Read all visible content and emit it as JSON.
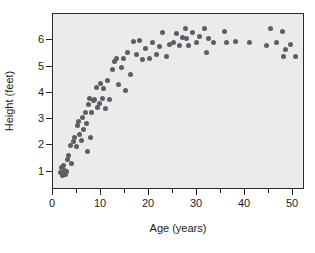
{
  "chart_data": {
    "type": "scatter",
    "title": "",
    "xlabel": "Age (years)",
    "ylabel": "Height (feet)",
    "xlim": [
      0,
      52.5
    ],
    "ylim": [
      0.3,
      7.0
    ],
    "xticks": [
      0,
      10,
      20,
      30,
      40,
      50
    ],
    "xticks_minor": [
      5,
      15,
      25,
      35,
      45
    ],
    "yticks": [
      1,
      2,
      3,
      4,
      5,
      6
    ],
    "grid": false,
    "legend": null,
    "point_color": "#595f66",
    "plot_background": "#ebebeb",
    "frame_color": "#2b2b2b",
    "series": [
      {
        "name": "Height vs Age",
        "points": [
          [
            1.6,
            0.95
          ],
          [
            1.8,
            1.15
          ],
          [
            1.9,
            0.85
          ],
          [
            2.1,
            1.25
          ],
          [
            2.4,
            1.05
          ],
          [
            2.6,
            0.9
          ],
          [
            2.8,
            1.0
          ],
          [
            3.0,
            1.45
          ],
          [
            3.3,
            1.6
          ],
          [
            3.6,
            2.0
          ],
          [
            3.9,
            1.3
          ],
          [
            4.2,
            2.15
          ],
          [
            4.5,
            2.3
          ],
          [
            4.8,
            1.95
          ],
          [
            5.1,
            2.75
          ],
          [
            5.3,
            2.9
          ],
          [
            5.6,
            2.4
          ],
          [
            5.9,
            2.2
          ],
          [
            6.2,
            3.05
          ],
          [
            6.4,
            2.6
          ],
          [
            6.7,
            3.25
          ],
          [
            6.9,
            2.85
          ],
          [
            7.1,
            1.75
          ],
          [
            7.4,
            3.55
          ],
          [
            7.6,
            3.8
          ],
          [
            7.8,
            2.3
          ],
          [
            8.1,
            3.25
          ],
          [
            8.4,
            3.7
          ],
          [
            8.7,
            3.75
          ],
          [
            9.0,
            4.2
          ],
          [
            9.3,
            3.45
          ],
          [
            9.6,
            3.6
          ],
          [
            9.9,
            4.35
          ],
          [
            10.3,
            3.8
          ],
          [
            10.6,
            4.15
          ],
          [
            11.0,
            3.4
          ],
          [
            11.4,
            4.45
          ],
          [
            11.8,
            3.75
          ],
          [
            12.3,
            4.9
          ],
          [
            12.8,
            5.2
          ],
          [
            13.2,
            5.3
          ],
          [
            13.6,
            4.3
          ],
          [
            14.2,
            4.95
          ],
          [
            14.7,
            5.3
          ],
          [
            15.1,
            4.1
          ],
          [
            15.6,
            5.55
          ],
          [
            16.2,
            4.7
          ],
          [
            16.8,
            5.95
          ],
          [
            17.4,
            5.45
          ],
          [
            18.0,
            6.0
          ],
          [
            18.6,
            5.25
          ],
          [
            19.3,
            5.7
          ],
          [
            20.0,
            5.3
          ],
          [
            20.8,
            5.9
          ],
          [
            21.5,
            5.45
          ],
          [
            22.2,
            5.75
          ],
          [
            22.9,
            6.3
          ],
          [
            23.6,
            5.4
          ],
          [
            24.3,
            5.85
          ],
          [
            25.1,
            5.9
          ],
          [
            25.8,
            6.25
          ],
          [
            26.4,
            5.8
          ],
          [
            27.0,
            6.1
          ],
          [
            27.5,
            6.45
          ],
          [
            27.9,
            6.05
          ],
          [
            28.3,
            5.8
          ],
          [
            29.0,
            6.3
          ],
          [
            29.8,
            5.9
          ],
          [
            30.5,
            6.15
          ],
          [
            31.5,
            6.45
          ],
          [
            32.0,
            5.55
          ],
          [
            32.4,
            6.05
          ],
          [
            33.5,
            5.9
          ],
          [
            35.8,
            6.35
          ],
          [
            36.2,
            5.9
          ],
          [
            38.0,
            5.95
          ],
          [
            41.0,
            5.9
          ],
          [
            44.5,
            5.8
          ],
          [
            45.3,
            6.45
          ],
          [
            46.5,
            5.9
          ],
          [
            47.8,
            6.35
          ],
          [
            48.0,
            5.4
          ],
          [
            48.5,
            5.65
          ],
          [
            49.5,
            5.85
          ],
          [
            50.5,
            5.4
          ]
        ]
      }
    ]
  }
}
